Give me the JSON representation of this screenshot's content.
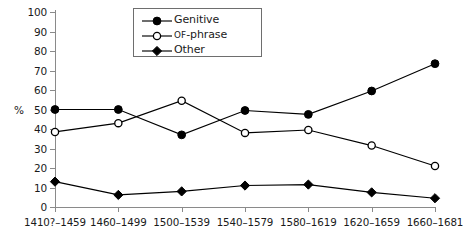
{
  "chart_data": {
    "type": "line",
    "title": "",
    "xlabel": "",
    "ylabel": "%",
    "ylim": [
      0,
      100
    ],
    "ytick_step": 10,
    "yticks": [
      0,
      10,
      20,
      30,
      40,
      50,
      60,
      70,
      80,
      90,
      100
    ],
    "grid": false,
    "legend_position": "top-center",
    "categories": [
      "1410?–1459",
      "1460–1499",
      "1500–1539",
      "1540–1579",
      "1580–1619",
      "1620–1659",
      "1660–1681"
    ],
    "series": [
      {
        "name": "Genitive",
        "marker": "filled-circle",
        "color": "#000000",
        "values": [
          50,
          50,
          37,
          49.5,
          47.5,
          59.5,
          73.5
        ]
      },
      {
        "name": "of-phrase",
        "marker": "open-circle",
        "color": "#000000",
        "values": [
          38.5,
          43,
          54.5,
          38,
          39.5,
          31.5,
          21
        ]
      },
      {
        "name": "Other",
        "marker": "filled-diamond",
        "color": "#000000",
        "values": [
          13,
          6.2,
          8,
          11,
          11.5,
          7.5,
          4.5
        ]
      }
    ]
  },
  "legend": {
    "items": [
      {
        "label": "Genitive",
        "label_prefix": "",
        "marker": "filled-circle"
      },
      {
        "label": "-phrase",
        "label_prefix": "of",
        "marker": "open-circle"
      },
      {
        "label": "Other",
        "label_prefix": "",
        "marker": "filled-diamond"
      }
    ]
  },
  "axis": {
    "y_title": "%"
  },
  "colors": {
    "line": "#000000",
    "axis": "#8a8a8a",
    "text": "#1a1a1a",
    "background": "#ffffff",
    "legend_border": "#6e6e6e"
  }
}
